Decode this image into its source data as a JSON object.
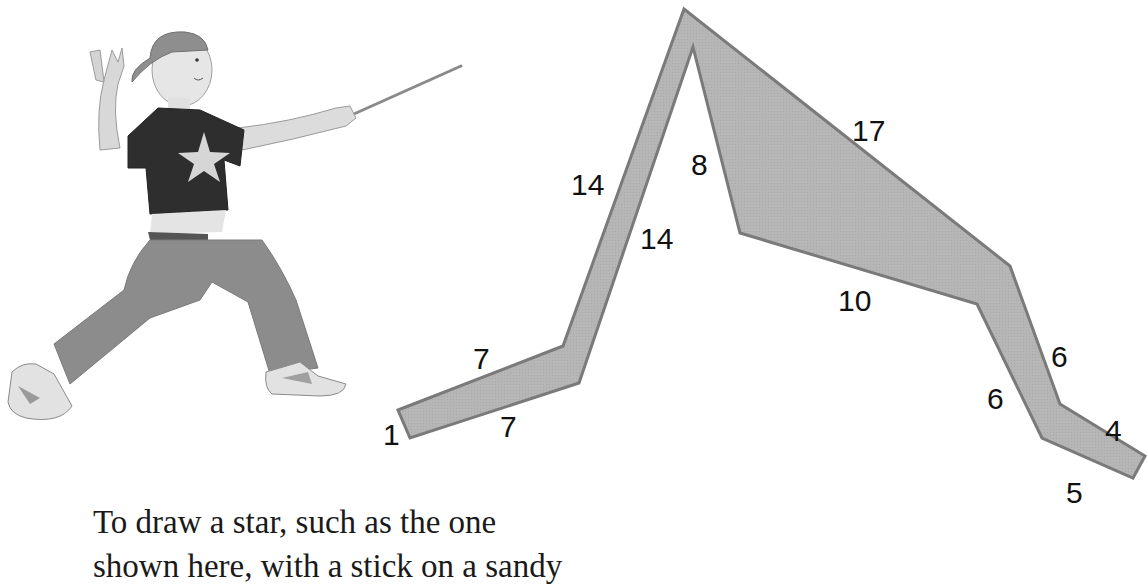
{
  "illustration": {
    "subject": "child pointing with a stick",
    "shirt_graphic": "star"
  },
  "diagram": {
    "shape": "star-outline-strip",
    "fill_color": "#b4b4b4",
    "stroke_color": "#7a7a7a",
    "labels": [
      {
        "id": "l1",
        "text": "1"
      },
      {
        "id": "l7a",
        "text": "7"
      },
      {
        "id": "l7b",
        "text": "7"
      },
      {
        "id": "l14a",
        "text": "14"
      },
      {
        "id": "l14b",
        "text": "14"
      },
      {
        "id": "l8",
        "text": "8"
      },
      {
        "id": "l17",
        "text": "17"
      },
      {
        "id": "l10",
        "text": "10"
      },
      {
        "id": "l6a",
        "text": "6"
      },
      {
        "id": "l6b",
        "text": "6"
      },
      {
        "id": "l4",
        "text": "4"
      },
      {
        "id": "l5",
        "text": "5"
      }
    ]
  },
  "text": {
    "line1": "To draw a star, such as the one",
    "line2": "shown here, with a stick on a sandy"
  }
}
